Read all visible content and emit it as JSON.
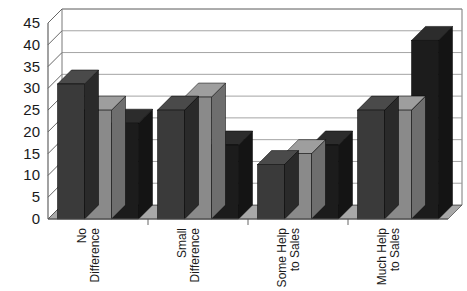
{
  "chart_data": {
    "type": "bar",
    "title": "",
    "subtitle": "",
    "xlabel": "",
    "ylabel": "",
    "ylim": [
      0,
      45
    ],
    "ytick_step": 5,
    "yticks": [
      0,
      5,
      10,
      15,
      20,
      25,
      30,
      35,
      40,
      45
    ],
    "ytick_labels": [
      "0",
      "5",
      "10",
      "15",
      "20",
      "25",
      "30",
      "35",
      "40",
      "45"
    ],
    "grid": true,
    "grid_axis": "y",
    "legend": false,
    "legend_position": "none",
    "three_d": true,
    "categories": [
      "No Difference",
      "Small Difference",
      "Some Help to Sales",
      "Much Help to Sales"
    ],
    "category_label_lines": [
      [
        "No",
        "Difference"
      ],
      [
        "Small",
        "Difference"
      ],
      [
        "Some Help",
        "to Sales"
      ],
      [
        "Much Help",
        "to Sales"
      ]
    ],
    "category_label_rotation": -90,
    "series": [
      {
        "name": "Series 1",
        "color": "#3a3a3a",
        "values": [
          31,
          25,
          12.5,
          25
        ]
      },
      {
        "name": "Series 2",
        "color": "#8a8a8a",
        "values": [
          25,
          28,
          15,
          25
        ]
      },
      {
        "name": "Series 3",
        "color": "#1c1c1c",
        "values": [
          22,
          17,
          17,
          41
        ]
      }
    ]
  },
  "colors": {
    "series1": "#3a3a3a",
    "series2": "#8a8a8a",
    "series3": "#1c1c1c",
    "series1_top": "#4a4a4a",
    "series2_top": "#9e9e9e",
    "series3_top": "#2c2c2c",
    "series1_side": "#2a2a2a",
    "series2_side": "#6e6e6e",
    "series3_side": "#141414",
    "grid_line": "#9a9a9a",
    "axis_line": "#555555",
    "floor": "#a8a8a8",
    "wall": "#ffffff",
    "text": "#1a1a1a",
    "background": "#ffffff"
  }
}
